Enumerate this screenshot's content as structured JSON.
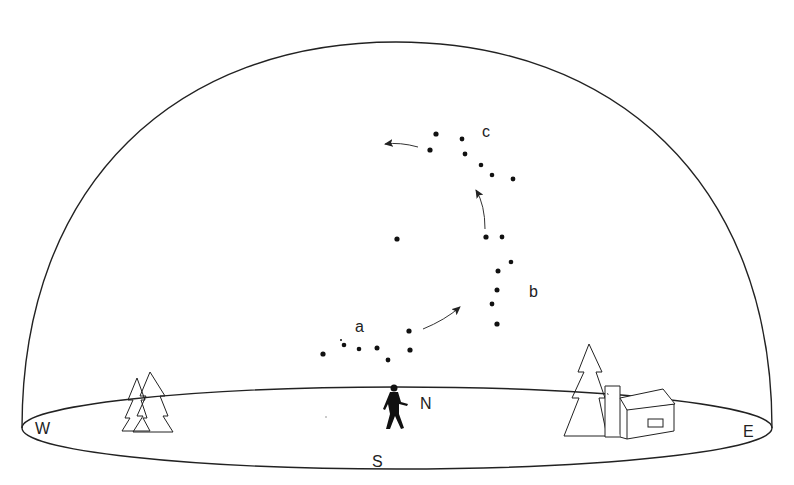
{
  "diagram": {
    "labels": {
      "a": "a",
      "b": "b",
      "c": "c",
      "north": "N",
      "south": "S",
      "west": "W",
      "east": "E"
    },
    "constellation_positions": [
      {
        "id": "a",
        "stars": [
          [
            323,
            354
          ],
          [
            344,
            345
          ],
          [
            359,
            349
          ],
          [
            377,
            348
          ],
          [
            388,
            360
          ],
          [
            409,
            331
          ],
          [
            410,
            350
          ]
        ]
      },
      {
        "id": "b",
        "stars": [
          [
            486,
            237
          ],
          [
            502,
            237
          ],
          [
            511,
            262
          ],
          [
            498,
            271
          ],
          [
            497,
            290
          ],
          [
            492,
            304
          ],
          [
            497,
            324
          ]
        ]
      },
      {
        "id": "c",
        "stars": [
          [
            436,
            134
          ],
          [
            430,
            150
          ],
          [
            462,
            139
          ],
          [
            465,
            154
          ],
          [
            481,
            165
          ],
          [
            492,
            175
          ],
          [
            513,
            179
          ]
        ]
      }
    ],
    "isolated_star": [
      397,
      239
    ],
    "arrows": [
      "a-to-b",
      "b-to-c",
      "c-westward"
    ],
    "colors": {
      "line": "#222222",
      "background": "#ffffff"
    }
  }
}
